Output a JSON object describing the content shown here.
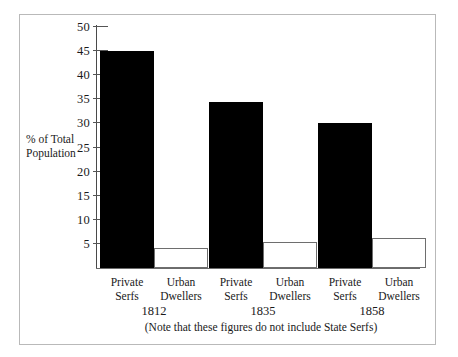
{
  "chart_data": {
    "type": "bar",
    "title": "",
    "xlabel": "",
    "ylabel": "% of Total Population",
    "ylim": [
      0,
      50
    ],
    "yticks": [
      5,
      10,
      15,
      20,
      25,
      30,
      35,
      40,
      45,
      50
    ],
    "grid": false,
    "legend": "none",
    "note": "(Note that these figures do not include State Serfs)",
    "categories": [
      "1812",
      "1835",
      "1858"
    ],
    "series": [
      {
        "name": "Private Serfs",
        "style": "solid-black",
        "values": [
          45.0,
          34.5,
          30.0
        ]
      },
      {
        "name": "Urban Dwellers",
        "style": "hollow-outline",
        "values": [
          4.1,
          5.4,
          6.2
        ]
      }
    ],
    "groups": [
      {
        "year": "1812",
        "bars": [
          {
            "label_line1": "Private",
            "label_line2": "Serfs",
            "value": 45.0,
            "style": "solid"
          },
          {
            "label_line1": "Urban",
            "label_line2": "Dwellers",
            "value": 4.1,
            "style": "hollow"
          }
        ]
      },
      {
        "year": "1835",
        "bars": [
          {
            "label_line1": "Private",
            "label_line2": "Serfs",
            "value": 34.5,
            "style": "solid"
          },
          {
            "label_line1": "Urban",
            "label_line2": "Dwellers",
            "value": 5.4,
            "style": "hollow"
          }
        ]
      },
      {
        "year": "1858",
        "bars": [
          {
            "label_line1": "Private",
            "label_line2": "Serfs",
            "value": 30.0,
            "style": "solid"
          },
          {
            "label_line1": "Urban",
            "label_line2": "Dwellers",
            "value": 6.2,
            "style": "hollow"
          }
        ]
      }
    ]
  },
  "axis": {
    "y_title_line1": "% of Total",
    "y_title_line2": "Population",
    "tick_labels": [
      "50",
      "45",
      "40",
      "35",
      "30",
      "25",
      "20",
      "15",
      "10",
      "5"
    ]
  },
  "colors": {
    "bar_solid": "#000000",
    "bar_hollow_fill": "#ffffff",
    "bar_hollow_stroke": "#6e6e6e",
    "axis": "#4a4a4a",
    "frame": "#b9b9b9",
    "text": "#1a1a1a"
  }
}
